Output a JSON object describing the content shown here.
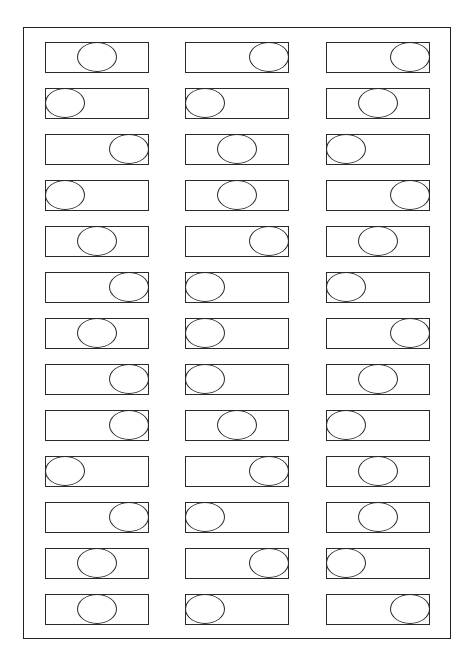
{
  "worksheet": {
    "rows": 13,
    "columns": 3,
    "line_color": "#2a2a2a",
    "background_color": "#ffffff",
    "positions_legend": {
      "L": "oval at left end of rectangle",
      "C": "oval centered in rectangle",
      "R": "oval at right end of rectangle"
    },
    "grid": [
      [
        "C",
        "R",
        "R"
      ],
      [
        "L",
        "L",
        "C"
      ],
      [
        "R",
        "C",
        "L"
      ],
      [
        "L",
        "C",
        "R"
      ],
      [
        "C",
        "R",
        "C"
      ],
      [
        "R",
        "L",
        "L"
      ],
      [
        "C",
        "L",
        "R"
      ],
      [
        "R",
        "L",
        "C"
      ],
      [
        "R",
        "C",
        "L"
      ],
      [
        "L",
        "R",
        "C"
      ],
      [
        "R",
        "L",
        "C"
      ],
      [
        "C",
        "R",
        "L"
      ],
      [
        "C",
        "L",
        "R"
      ]
    ]
  }
}
